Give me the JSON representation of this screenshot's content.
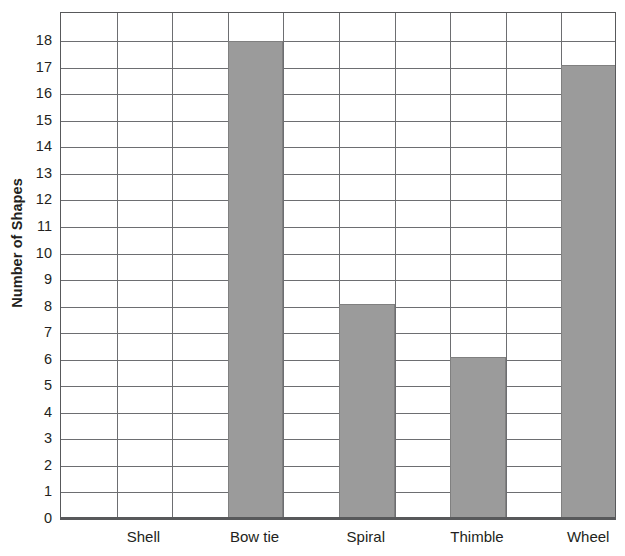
{
  "chart_data": {
    "type": "bar",
    "title": "",
    "xlabel": "",
    "ylabel": "Number of Shapes",
    "categories": [
      "Shell",
      "Bow tie",
      "Spiral",
      "Thimble",
      "Wheel"
    ],
    "values": [
      0,
      18,
      8.1,
      6.1,
      17.1
    ],
    "ylim": [
      0,
      19
    ],
    "ytick_labels": [
      "0",
      "1",
      "2",
      "3",
      "4",
      "5",
      "6",
      "7",
      "8",
      "9",
      "10",
      "11",
      "12",
      "13",
      "14",
      "15",
      "16",
      "17",
      "18"
    ],
    "ytick_values": [
      0,
      1,
      2,
      3,
      4,
      5,
      6,
      7,
      8,
      9,
      10,
      11,
      12,
      13,
      14,
      15,
      16,
      17,
      18
    ],
    "grid": true,
    "grid_axis": "both",
    "n_grid_columns": 10,
    "bar_columns": [
      3,
      5,
      7,
      9
    ],
    "legend": null,
    "bar_color": "#9b9b9b",
    "bar_edge_color": "#808080",
    "grid_color": "#6d6e71",
    "axis_color": "#58595b",
    "background_color": "#ffffff"
  }
}
